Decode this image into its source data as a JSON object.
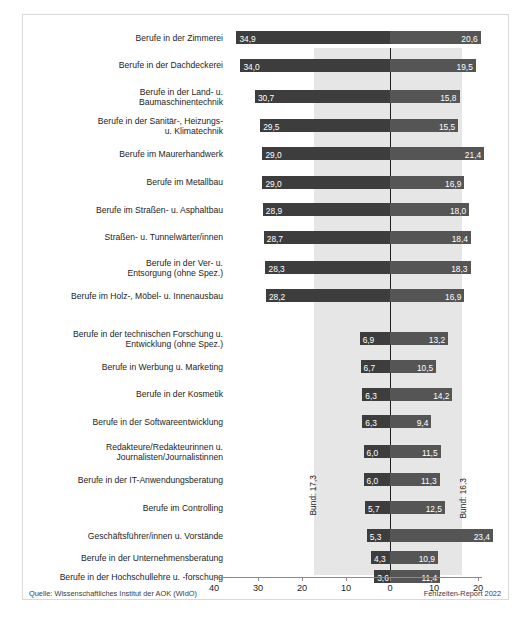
{
  "header": {
    "left_title": "Fälle je 100 AOK-Mitglieder",
    "right_title": "Tage je Fall"
  },
  "footer": {
    "source": "Quelle: Wissenschaftliches Institut der AOK (WIdO)",
    "report": "Fehlzeiten-Report 2022"
  },
  "reference": {
    "left_label": "Bund: 17,3",
    "right_label": "Bund: 16,3",
    "left_value": 17.3,
    "right_value": 16.3
  },
  "axis": {
    "ticks": [
      "40",
      "30",
      "20",
      "10",
      "0",
      "10",
      "20"
    ],
    "tick_values": [
      -40,
      -30,
      -20,
      -10,
      0,
      10,
      20
    ]
  },
  "chart_data": {
    "type": "bar",
    "title": "",
    "subtitle": "",
    "xlabel": "",
    "ylabel": "",
    "orientation": "horizontal-diverging",
    "grid": false,
    "legend": false,
    "xlim": [
      -42,
      25
    ],
    "axis_ticks": [
      40,
      30,
      20,
      10,
      0,
      10,
      20
    ],
    "series": [
      {
        "name": "Fälle je 100 AOK-Mitglieder",
        "side": "left",
        "color": "#3d3d3d"
      },
      {
        "name": "Tage je Fall",
        "side": "right",
        "color": "#555555"
      }
    ],
    "reference_bands": {
      "bund_faelle": 17.3,
      "bund_tage": 16.3
    },
    "categories": [
      "Berufe in der Zimmerei",
      "Berufe in der Dachdeckerei",
      "Berufe in der Land- u. Baumaschinentechnik",
      "Berufe in der Sanitär-, Heizungs- u. Klimatechnik",
      "Berufe im Maurerhandwerk",
      "Berufe im Metallbau",
      "Berufe im Straßen- u. Asphaltbau",
      "Straßen- u. Tunnelwärter/innen",
      "Berufe in der Ver- u. Entsorgung (ohne Spez.)",
      "Berufe im Holz-, Möbel- u. Innenausbau",
      "Berufe in der technischen Forschung u. Entwicklung (ohne Spez.)",
      "Berufe in Werbung u. Marketing",
      "Berufe in der Kosmetik",
      "Berufe in der Softwareentwicklung",
      "Redakteure/Redakteurinnen u. Journalisten/Journalistinnen",
      "Berufe in der IT-Anwendungsberatung",
      "Berufe im Controlling",
      "Geschäftsführer/innen u. Vorstände",
      "Berufe in der Unternehmensberatung",
      "Berufe in der Hochschullehre u. -forschung"
    ],
    "faelle": [
      34.9,
      34.0,
      30.7,
      29.5,
      29.0,
      29.0,
      28.9,
      28.7,
      28.3,
      28.2,
      6.9,
      6.7,
      6.3,
      6.3,
      6.0,
      6.0,
      5.7,
      5.3,
      4.3,
      3.6
    ],
    "tage": [
      20.6,
      19.5,
      15.8,
      15.5,
      21.4,
      16.9,
      18.0,
      18.4,
      18.3,
      16.9,
      13.2,
      10.5,
      14.2,
      9.4,
      11.5,
      11.3,
      12.5,
      23.4,
      10.9,
      11.4
    ]
  },
  "rows": [
    {
      "label_lines": [
        "Berufe in der Zimmerei"
      ],
      "faelle": "34,9",
      "tage": "20,6"
    },
    {
      "label_lines": [
        "Berufe in der Dachdeckerei"
      ],
      "faelle": "34,0",
      "tage": "19,5"
    },
    {
      "label_lines": [
        "Berufe in der Land- u.",
        "Baumaschinentechnik"
      ],
      "faelle": "30,7",
      "tage": "15,8"
    },
    {
      "label_lines": [
        "Berufe in der Sanitär-, Heizungs-",
        "u. Klimatechnik"
      ],
      "faelle": "29,5",
      "tage": "15,5"
    },
    {
      "label_lines": [
        "Berufe im Maurerhandwerk"
      ],
      "faelle": "29,0",
      "tage": "21,4"
    },
    {
      "label_lines": [
        "Berufe im Metallbau"
      ],
      "faelle": "29,0",
      "tage": "16,9"
    },
    {
      "label_lines": [
        "Berufe im Straßen- u. Asphaltbau"
      ],
      "faelle": "28,9",
      "tage": "18,0"
    },
    {
      "label_lines": [
        "Straßen- u. Tunnelwärter/innen"
      ],
      "faelle": "28,7",
      "tage": "18,4"
    },
    {
      "label_lines": [
        "Berufe in der Ver- u.",
        "Entsorgung (ohne Spez.)"
      ],
      "faelle": "28,3",
      "tage": "18,3"
    },
    {
      "label_lines": [
        "Berufe im Holz-, Möbel- u. Innenausbau"
      ],
      "faelle": "28,2",
      "tage": "16,9"
    },
    {
      "label_lines": [
        "Berufe in der technischen Forschung u.",
        "Entwicklung (ohne Spez.)"
      ],
      "faelle": "6,9",
      "tage": "13,2"
    },
    {
      "label_lines": [
        "Berufe in Werbung u. Marketing"
      ],
      "faelle": "6,7",
      "tage": "10,5"
    },
    {
      "label_lines": [
        "Berufe in der Kosmetik"
      ],
      "faelle": "6,3",
      "tage": "14,2"
    },
    {
      "label_lines": [
        "Berufe in der Softwareentwicklung"
      ],
      "faelle": "6,3",
      "tage": "9,4"
    },
    {
      "label_lines": [
        "Redakteure/Redakteurinnen u.",
        "Journalisten/Journalistinnen"
      ],
      "faelle": "6,0",
      "tage": "11,5"
    },
    {
      "label_lines": [
        "Berufe in der IT-Anwendungsberatung"
      ],
      "faelle": "6,0",
      "tage": "11,3"
    },
    {
      "label_lines": [
        "Berufe im Controlling"
      ],
      "faelle": "5,7",
      "tage": "12,5"
    },
    {
      "label_lines": [
        "Geschäftsführer/innen u. Vorstände"
      ],
      "faelle": "5,3",
      "tage": "23,4"
    },
    {
      "label_lines": [
        "Berufe in der Unternehmensberatung"
      ],
      "faelle": "4,3",
      "tage": "10,9"
    },
    {
      "label_lines": [
        "Berufe in der Hochschullehre u. -forschung"
      ],
      "faelle": "3,6",
      "tage": "11,4"
    }
  ]
}
